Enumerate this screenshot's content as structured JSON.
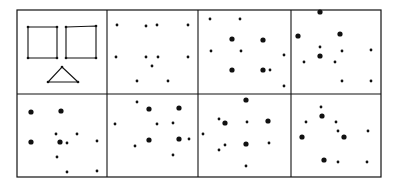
{
  "figure": {
    "type": "dot-pattern stimulus grid",
    "rows": 2,
    "cols": 4,
    "ink_color": "#111111",
    "paper_color": "#ffffff",
    "frame": {
      "x1": 17,
      "y1": 10,
      "x2": 381,
      "y2": 177
    },
    "row_divider_y": 94,
    "col_dividers_x": [
      107,
      198,
      291
    ],
    "cells": [
      {
        "id": "r1c1",
        "kind": "shapes",
        "shapes": [
          {
            "type": "square",
            "points": [
              [
                28,
                27
              ],
              [
                57,
                27
              ],
              [
                57,
                58
              ],
              [
                28,
                58
              ]
            ]
          },
          {
            "type": "square",
            "points": [
              [
                66,
                27
              ],
              [
                96,
                26
              ],
              [
                96,
                58
              ],
              [
                66,
                58
              ]
            ]
          },
          {
            "type": "triangle",
            "points": [
              [
                62,
                67
              ],
              [
                78,
                82
              ],
              [
                48,
                82
              ]
            ]
          }
        ]
      },
      {
        "id": "r1c2",
        "kind": "dots",
        "large": [],
        "small": [
          [
            117,
            25
          ],
          [
            146,
            26
          ],
          [
            157,
            25
          ],
          [
            188,
            25
          ],
          [
            116,
            57
          ],
          [
            146,
            57
          ],
          [
            158,
            57
          ],
          [
            188,
            57
          ],
          [
            152,
            66
          ],
          [
            137,
            81
          ],
          [
            168,
            81
          ]
        ]
      },
      {
        "id": "r1c3",
        "kind": "dots",
        "large": [
          [
            232,
            39
          ],
          [
            263,
            40
          ],
          [
            232,
            70
          ],
          [
            263,
            70
          ]
        ],
        "small": [
          [
            210,
            19
          ],
          [
            240,
            19
          ],
          [
            211,
            51
          ],
          [
            241,
            51
          ],
          [
            284,
            55
          ],
          [
            284,
            86
          ],
          [
            270,
            70
          ]
        ]
      },
      {
        "id": "r1c4",
        "kind": "dots",
        "large": [
          [
            320,
            12
          ],
          [
            298,
            36
          ],
          [
            340,
            34
          ],
          [
            320,
            56
          ]
        ],
        "small": [
          [
            320,
            47
          ],
          [
            342,
            51
          ],
          [
            371,
            50
          ],
          [
            304,
            62
          ],
          [
            335,
            62
          ],
          [
            342,
            81
          ],
          [
            371,
            81
          ]
        ]
      },
      {
        "id": "r2c1",
        "kind": "dots",
        "large": [
          [
            31,
            112
          ],
          [
            61,
            111
          ],
          [
            31,
            142
          ],
          [
            60,
            142
          ]
        ],
        "small": [
          [
            56,
            134
          ],
          [
            77,
            134
          ],
          [
            67,
            143
          ],
          [
            97,
            141
          ],
          [
            57,
            157
          ],
          [
            67,
            172
          ],
          [
            97,
            171
          ]
        ]
      },
      {
        "id": "r2c2",
        "kind": "dots",
        "large": [
          [
            149,
            109
          ],
          [
            179,
            108
          ],
          [
            149,
            140
          ],
          [
            179,
            139
          ]
        ],
        "small": [
          [
            137,
            102
          ],
          [
            115,
            124
          ],
          [
            157,
            124
          ],
          [
            173,
            123
          ],
          [
            189,
            139
          ],
          [
            135,
            146
          ],
          [
            173,
            155
          ]
        ]
      },
      {
        "id": "r2c3",
        "kind": "dots",
        "large": [
          [
            246,
            100
          ],
          [
            225,
            123
          ],
          [
            268,
            121
          ],
          [
            246,
            144
          ]
        ],
        "small": [
          [
            219,
            119
          ],
          [
            247,
            122
          ],
          [
            203,
            134
          ],
          [
            225,
            145
          ],
          [
            269,
            143
          ],
          [
            219,
            150
          ],
          [
            246,
            166
          ]
        ]
      },
      {
        "id": "r2c4",
        "kind": "dots",
        "large": [
          [
            322,
            116
          ],
          [
            302,
            137
          ],
          [
            344,
            137
          ],
          [
            324,
            160
          ]
        ],
        "small": [
          [
            321,
            107
          ],
          [
            306,
            122
          ],
          [
            336,
            122
          ],
          [
            338,
            131
          ],
          [
            368,
            131
          ],
          [
            338,
            162
          ],
          [
            367,
            162
          ]
        ]
      }
    ]
  }
}
